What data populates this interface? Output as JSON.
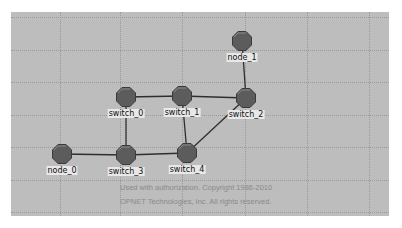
{
  "diagram": {
    "background_color": "#bdbdbd",
    "node_color": "#5c5c5c",
    "link_color": "#2e2e2e",
    "nodes": [
      {
        "id": "node_0",
        "label": "node_0",
        "x": 62,
        "y": 154
      },
      {
        "id": "node_1",
        "label": "node_1",
        "x": 242,
        "y": 41
      },
      {
        "id": "switch_0",
        "label": "switch_0",
        "x": 126,
        "y": 97
      },
      {
        "id": "switch_1",
        "label": "switch_1",
        "x": 182,
        "y": 96
      },
      {
        "id": "switch_2",
        "label": "switch_2",
        "x": 246,
        "y": 98
      },
      {
        "id": "switch_3",
        "label": "switch_3",
        "x": 126,
        "y": 155
      },
      {
        "id": "switch_4",
        "label": "switch_4",
        "x": 187,
        "y": 153
      }
    ],
    "links": [
      [
        "switch_0",
        "switch_1"
      ],
      [
        "switch_1",
        "switch_2"
      ],
      [
        "node_1",
        "switch_2"
      ],
      [
        "switch_0",
        "switch_3"
      ],
      [
        "switch_1",
        "switch_4"
      ],
      [
        "switch_2",
        "switch_4"
      ],
      [
        "node_0",
        "switch_3"
      ],
      [
        "switch_3",
        "switch_4"
      ]
    ]
  },
  "copyright": {
    "line1": "Used with authorization. Copyright 1986-2010",
    "line2": "OPNET Technologies, Inc.  All rights reserved."
  }
}
